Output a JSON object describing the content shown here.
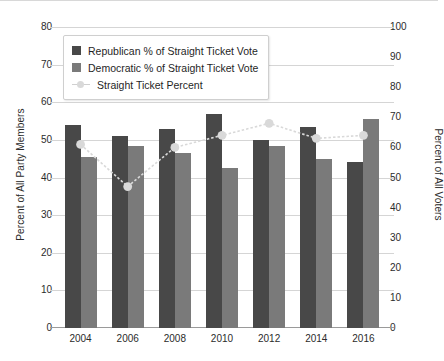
{
  "chart_data": {
    "type": "bar",
    "title": "",
    "xlabel": "",
    "ylabel": "Percent of All Party Members",
    "ylabel_right": "Percent of All Voters",
    "categories": [
      "2004",
      "2006",
      "2008",
      "2010",
      "2012",
      "2014",
      "2016"
    ],
    "ylim": [
      0,
      80
    ],
    "ylim_right": [
      0,
      100
    ],
    "yticks": [
      80,
      70,
      60,
      50,
      40,
      30,
      20,
      10,
      0
    ],
    "yticks_right": [
      100,
      90,
      80,
      70,
      60,
      50,
      40,
      30,
      20,
      10,
      0
    ],
    "grid": true,
    "legend_position": "upper-left-inside",
    "series": [
      {
        "name": "Republican % of Straight Ticket Vote",
        "type": "bar",
        "axis": "left",
        "color": "#484848",
        "values": [
          54,
          51,
          53,
          57,
          50,
          53.5,
          44
        ]
      },
      {
        "name": "Democratic % of Straight Ticket Vote",
        "type": "bar",
        "axis": "left",
        "color": "#7a7a7a",
        "values": [
          45.5,
          48.5,
          46.5,
          42.5,
          48.5,
          45,
          55.5
        ]
      },
      {
        "name": "Straight Ticket Percent",
        "type": "line",
        "axis": "right",
        "color": "#d9d9d9",
        "values": [
          61,
          47,
          60,
          64,
          68,
          63,
          64
        ]
      }
    ]
  },
  "legend": {
    "items": [
      {
        "label": "Republican % of Straight Ticket Vote"
      },
      {
        "label": "Democratic % of Straight Ticket Vote"
      },
      {
        "label": "Straight Ticket Percent"
      }
    ]
  },
  "axes": {
    "left_title": "Percent of All Party Members",
    "right_title": "Percent of All Voters",
    "left_ticks": [
      "80",
      "70",
      "60",
      "50",
      "40",
      "30",
      "20",
      "10",
      "0"
    ],
    "right_ticks": [
      "100",
      "90",
      "80",
      "70",
      "60",
      "50",
      "40",
      "30",
      "20",
      "10",
      "0"
    ],
    "x_ticks": [
      "2004",
      "2006",
      "2008",
      "2010",
      "2012",
      "2014",
      "2016"
    ]
  },
  "colors": {
    "republican": "#484848",
    "democratic": "#7a7a7a",
    "line": "#d9d9d9",
    "grid": "#d5d5d5",
    "axis": "#9a9a9a",
    "text": "#2b2b2b"
  }
}
